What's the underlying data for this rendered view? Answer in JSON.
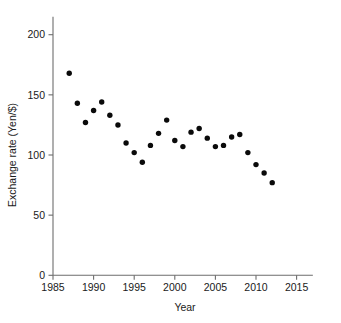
{
  "chart_data": {
    "type": "scatter",
    "title": "",
    "xlabel": "Year",
    "ylabel": "Exchange rate (Yen/$)",
    "xlim": [
      1985,
      2017
    ],
    "ylim": [
      0,
      215
    ],
    "grid": false,
    "legend": null,
    "xticks": [
      1985,
      1990,
      1995,
      2000,
      2005,
      2010,
      2015
    ],
    "xtick_labels": [
      "1985",
      "1990",
      "1995",
      "2000",
      "2005",
      "2010",
      "2015"
    ],
    "yticks": [
      0,
      50,
      100,
      150,
      200
    ],
    "ytick_labels": [
      "0",
      "50",
      "100",
      "150",
      "200"
    ],
    "marker": "filled-circle",
    "marker_color": "#0a0a0a",
    "x": [
      1987,
      1988,
      1989,
      1990,
      1991,
      1992,
      1993,
      1994,
      1995,
      1996,
      1997,
      1998,
      1999,
      2000,
      2001,
      2002,
      2003,
      2004,
      2005,
      2006,
      2007,
      2008,
      2009,
      2010,
      2011,
      2012
    ],
    "values": [
      168,
      143,
      127,
      137,
      144,
      133,
      125,
      110,
      102,
      94,
      108,
      118,
      129,
      112,
      107,
      119,
      122,
      114,
      107,
      108,
      115,
      117,
      102,
      92,
      85,
      77
    ],
    "series": [
      {
        "name": "Exchange rate (Yen/$)",
        "values": [
          168,
          143,
          127,
          137,
          144,
          133,
          125,
          110,
          102,
          94,
          108,
          118,
          129,
          112,
          107,
          119,
          122,
          114,
          107,
          108,
          115,
          117,
          102,
          92,
          85,
          77
        ]
      }
    ]
  },
  "axes": {
    "x_title": "Year",
    "y_title": "Exchange rate (Yen/$)"
  }
}
